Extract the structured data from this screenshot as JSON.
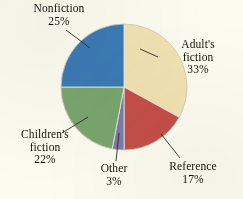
{
  "background_color": "#fbfbef",
  "text_color": "#15120d",
  "chart_data": {
    "type": "pie",
    "title": "",
    "subtitle": "",
    "xlabel": "",
    "ylabel": "",
    "legend_position": "none",
    "grid": false,
    "labels_outside_with_leader_lines": true,
    "total_percent": 100,
    "start_angle_deg": 0,
    "direction": "clockwise",
    "categories": [
      "Adult's fiction",
      "Reference",
      "Other",
      "Children's fiction",
      "Nonfiction"
    ],
    "values": [
      33,
      17,
      3,
      22,
      25
    ],
    "value_suffix": "%",
    "colors": [
      "#f0e2b2",
      "#c44e48",
      "#7d7aaa",
      "#7aa56d",
      "#3b7ab4"
    ],
    "slices": [
      {
        "name": "Adult's fiction",
        "label_line1": "Adult's",
        "label_line2": "fiction",
        "value": 33,
        "value_text": "33%",
        "color": "#f0e2b2",
        "start_deg": 0,
        "end_deg": 118.8
      },
      {
        "name": "Reference",
        "label_line1": "Reference",
        "label_line2": "",
        "value": 17,
        "value_text": "17%",
        "color": "#c44e48",
        "start_deg": 118.8,
        "end_deg": 180.0
      },
      {
        "name": "Other",
        "label_line1": "Other",
        "label_line2": "",
        "value": 3,
        "value_text": "3%",
        "color": "#7d7aaa",
        "start_deg": 180.0,
        "end_deg": 190.8
      },
      {
        "name": "Children's fiction",
        "label_line1": "Children's",
        "label_line2": "fiction",
        "value": 22,
        "value_text": "22%",
        "color": "#7aa56d",
        "start_deg": 190.8,
        "end_deg": 270.0
      },
      {
        "name": "Nonfiction",
        "label_line1": "Nonfiction",
        "label_line2": "",
        "value": 25,
        "value_text": "25%",
        "color": "#3b7ab4",
        "start_deg": 270.0,
        "end_deg": 360.0
      }
    ]
  },
  "labels": {
    "nonfiction": {
      "name": "Nonfiction",
      "percent": "25%"
    },
    "adults_fiction": {
      "line1": "Adult's",
      "line2": "fiction",
      "percent": "33%"
    },
    "childrens_fiction": {
      "line1": "Children's",
      "line2": "fiction",
      "percent": "22%"
    },
    "other": {
      "name": "Other",
      "percent": "3%"
    },
    "reference": {
      "name": "Reference",
      "percent": "17%"
    }
  }
}
